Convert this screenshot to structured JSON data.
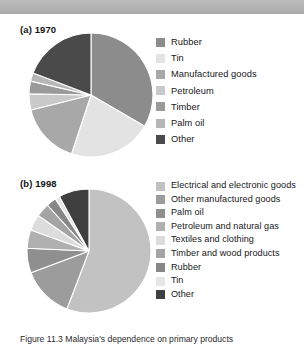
{
  "figure": {
    "caption": "Figure 11.3 Malaysia's dependence on primary products"
  },
  "banner": {
    "color": "#b4b4b4"
  },
  "charts": [
    {
      "panel_label": "(a) 1970",
      "legend_items": [
        {
          "label": "Rubber",
          "color": "#8c8c8c"
        },
        {
          "label": "Tin",
          "color": "#e3e3e3"
        },
        {
          "label": "Manufactured goods",
          "color": "#a8a8a8"
        },
        {
          "label": "Petroleum",
          "color": "#c9c9c9"
        },
        {
          "label": "Timber",
          "color": "#9a9a9a"
        },
        {
          "label": "Palm oil",
          "color": "#b6b6b6"
        },
        {
          "label": "Other",
          "color": "#4a4a4a"
        }
      ]
    },
    {
      "panel_label": "(b) 1998",
      "legend_items": [
        {
          "label": "Electrical and electronic goods",
          "color": "#c2c2c2"
        },
        {
          "label": "Other manufactured goods",
          "color": "#9c9c9c"
        },
        {
          "label": "Palm oil",
          "color": "#8f8f8f"
        },
        {
          "label": "Petroleum and natural gas",
          "color": "#b0b0b0"
        },
        {
          "label": "Textiles and clothing",
          "color": "#dcdcdc"
        },
        {
          "label": "Timber and wood products",
          "color": "#a4a4a4"
        },
        {
          "label": "Rubber",
          "color": "#878787"
        },
        {
          "label": "Tin",
          "color": "#e6e6e6"
        },
        {
          "label": "Other",
          "color": "#3f3f3f"
        }
      ]
    }
  ],
  "chart_data": [
    {
      "type": "pie",
      "title": "(a) 1970",
      "labels": [
        "Rubber",
        "Tin",
        "Manufactured goods",
        "Petroleum",
        "Timber",
        "Palm oil",
        "Other"
      ],
      "values": [
        33.4,
        21.7,
        16.0,
        4.2,
        3.3,
        2.2,
        19.2
      ],
      "colors": [
        "#8c8c8c",
        "#e3e3e3",
        "#a8a8a8",
        "#c9c9c9",
        "#9a9a9a",
        "#b6b6b6",
        "#4a4a4a"
      ],
      "start_angle": 0,
      "legend_position": "right",
      "grid": false
    },
    {
      "type": "pie",
      "title": "(b) 1998",
      "labels": [
        "Electrical and electronic goods",
        "Other manufactured goods",
        "Palm oil",
        "Petroleum and natural gas",
        "Textiles and clothing",
        "Timber and wood products",
        "Rubber",
        "Tin",
        "Other"
      ],
      "values": [
        55.8,
        13.5,
        6.4,
        4.8,
        4.2,
        3.6,
        2.6,
        1.2,
        7.9
      ],
      "colors": [
        "#c2c2c2",
        "#9c9c9c",
        "#8f8f8f",
        "#b0b0b0",
        "#dcdcdc",
        "#a4a4a4",
        "#878787",
        "#e6e6e6",
        "#3f3f3f"
      ],
      "start_angle": 0,
      "legend_position": "right",
      "grid": false
    }
  ]
}
